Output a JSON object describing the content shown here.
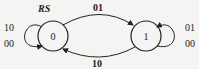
{
  "diagram": {
    "input_label": "RS",
    "states": [
      {
        "id": "0",
        "label": "0"
      },
      {
        "id": "1",
        "label": "1"
      }
    ],
    "transitions": [
      {
        "from": "0",
        "to": "1",
        "label": "01"
      },
      {
        "from": "1",
        "to": "0",
        "label": "10"
      }
    ],
    "self_loops": {
      "state0": [
        "10",
        "00"
      ],
      "state1": [
        "01",
        "00"
      ]
    },
    "colors": {
      "stroke": "#222222",
      "background": "#f4f4f2"
    }
  }
}
